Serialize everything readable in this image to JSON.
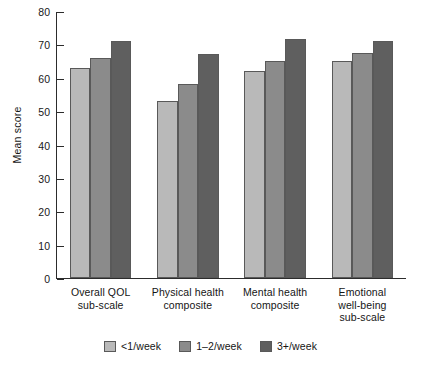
{
  "figure": {
    "clipped_title": "",
    "background": "#ffffff"
  },
  "chart_data": {
    "type": "bar",
    "title": "",
    "xlabel": "",
    "ylabel": "Mean score",
    "ylim": [
      0,
      80
    ],
    "yticks": [
      0,
      10,
      20,
      30,
      40,
      50,
      60,
      70,
      80
    ],
    "ytick_labels": [
      "0",
      "10",
      "20",
      "30",
      "40",
      "50",
      "60",
      "70",
      "80"
    ],
    "grid": false,
    "legend_position": "bottom-center",
    "categories": [
      "Overall QOL\nsub-scale",
      "Physical health\ncomposite",
      "Mental health\ncomposite",
      "Emotional\nwell-being\nsub-scale"
    ],
    "category_lines": [
      [
        "Overall QOL",
        "sub-scale"
      ],
      [
        "Physical health",
        "composite"
      ],
      [
        "Mental health",
        "composite"
      ],
      [
        "Emotional",
        "well-being",
        "sub-scale"
      ]
    ],
    "series": [
      {
        "name": "<1/week",
        "color": "#b9b9b9",
        "values": [
          63,
          53,
          62,
          65
        ]
      },
      {
        "name": "1–2/week",
        "color": "#8b8b8b",
        "values": [
          66,
          58,
          65,
          67.5
        ]
      },
      {
        "name": "3+/week",
        "color": "#5f5f5f",
        "values": [
          71,
          67,
          71.5,
          71
        ]
      }
    ]
  },
  "legend": {
    "items": [
      {
        "label": "<1/week",
        "color": "#b9b9b9"
      },
      {
        "label": "1–2/week",
        "color": "#8b8b8b"
      },
      {
        "label": "3+/week",
        "color": "#5f5f5f"
      }
    ]
  },
  "axis": {
    "y_label": "Mean score",
    "tick_0": "0",
    "tick_10": "10",
    "tick_20": "20",
    "tick_30": "30",
    "tick_40": "40",
    "tick_50": "50",
    "tick_60": "60",
    "tick_70": "70",
    "tick_80": "80"
  }
}
